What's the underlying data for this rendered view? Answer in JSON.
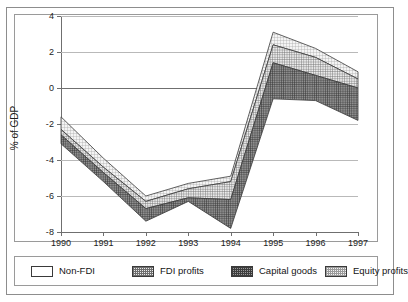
{
  "chart_data": {
    "type": "area",
    "title": "",
    "subtitle": "",
    "xlabel": "",
    "ylabel": "% of GDP",
    "categories": [
      "1990",
      "1991",
      "1992",
      "1993",
      "1994",
      "1995",
      "1996",
      "1997"
    ],
    "x": [
      1990,
      1991,
      1992,
      1993,
      1994,
      1995,
      1996,
      1997
    ],
    "ylim": [
      -8,
      4
    ],
    "yticks": [
      4,
      2,
      0,
      -2,
      -4,
      -6,
      -8
    ],
    "ytick_labels": [
      "4",
      "2",
      "0",
      "-2",
      "-4",
      "-6",
      "-8"
    ],
    "xticks": [
      1990,
      1991,
      1992,
      1993,
      1994,
      1995,
      1996,
      1997
    ],
    "grid": true,
    "grid_axis": "y",
    "legend_position": "bottom",
    "stacked_band_note": "Cumulative boundary curves plotted as % of GDP; bands are the areas between successive boundaries.",
    "boundaries": {
      "equity_profits_top": [
        -1.6,
        -3.9,
        -6.0,
        -5.3,
        -4.9,
        3.1,
        2.2,
        0.9
      ],
      "fdi_profits_top": [
        -2.3,
        -4.4,
        -6.3,
        -5.6,
        -5.2,
        2.4,
        1.7,
        0.5
      ],
      "capital_goods_top": [
        -2.6,
        -4.7,
        -6.7,
        -6.1,
        -6.2,
        1.4,
        0.7,
        0.0
      ],
      "non_fdi_bottom": [
        -3.1,
        -5.2,
        -7.4,
        -6.3,
        -7.8,
        -0.6,
        -0.7,
        -1.8
      ]
    },
    "series": [
      {
        "name": "Equity profits",
        "fill": "light-crosshatch",
        "values": [
          0.7,
          0.5,
          0.3,
          0.3,
          0.3,
          0.7,
          0.5,
          0.4
        ]
      },
      {
        "name": "FDI profits",
        "fill": "medium-crosshatch",
        "values": [
          0.3,
          0.3,
          0.4,
          0.5,
          1.0,
          1.0,
          1.0,
          0.5
        ]
      },
      {
        "name": "Capital goods",
        "fill": "dark-crosshatch",
        "values": [
          0.5,
          0.5,
          0.7,
          0.2,
          1.6,
          2.0,
          1.4,
          1.8
        ]
      },
      {
        "name": "Non-FDI",
        "fill": "white",
        "values": [
          0,
          0,
          0,
          0,
          0,
          0,
          0,
          0
        ]
      }
    ],
    "legend": [
      {
        "label": "Non-FDI",
        "swatch": "white",
        "swatch_class": "sw-nonfdi"
      },
      {
        "label": "FDI profits",
        "swatch": "medium-crosshatch",
        "swatch_class": "sw-fdi"
      },
      {
        "label": "Capital goods",
        "swatch": "dark-crosshatch",
        "swatch_class": "sw-capital"
      },
      {
        "label": "Equity profits",
        "swatch": "light-crosshatch",
        "swatch_class": "sw-equity"
      }
    ],
    "colors": {
      "grid": "#b9b9b9",
      "axis": "#6f6f6f",
      "frame": "#9a9a9a",
      "outline": "#3a3a3a",
      "equity_fill": "#f3f3f3",
      "fdi_fill": "#e9e9e9",
      "capital_fill": "#9a9a9a",
      "background": "#ffffff"
    }
  }
}
